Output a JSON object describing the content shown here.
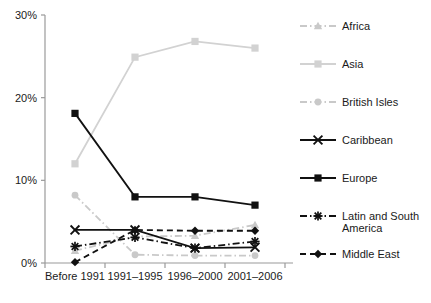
{
  "chart_data": {
    "type": "line",
    "title": "",
    "subtitle": "",
    "xlabel": "",
    "ylabel": "",
    "categories": [
      "Before 1991",
      "1991–1995",
      "1996–2000",
      "2001–2006"
    ],
    "ylim": [
      0,
      30
    ],
    "yticks": [
      0,
      10,
      20,
      30
    ],
    "ytick_labels": [
      "0%",
      "10%",
      "20%",
      "30%"
    ],
    "grid": false,
    "legend_position": "right",
    "value_unit": "percent",
    "series": [
      {
        "name": "Africa",
        "values": [
          1.5,
          3.2,
          3.3,
          4.6
        ],
        "color": "#c9c9c9",
        "marker": "triangle",
        "line_style": "dash-dot"
      },
      {
        "name": "Asia",
        "values": [
          12.0,
          24.9,
          26.8,
          26.0
        ],
        "color": "#d2d2d2",
        "marker": "square",
        "line_style": "solid"
      },
      {
        "name": "British Isles",
        "values": [
          8.2,
          1.0,
          0.9,
          0.9
        ],
        "color": "#c9c9c9",
        "marker": "circle",
        "line_style": "dash-dot"
      },
      {
        "name": "Caribbean",
        "values": [
          4.0,
          4.0,
          1.8,
          1.9
        ],
        "color": "#111111",
        "marker": "x",
        "line_style": "solid"
      },
      {
        "name": "Europe",
        "values": [
          18.1,
          8.0,
          8.0,
          7.0
        ],
        "color": "#111111",
        "marker": "square",
        "line_style": "solid"
      },
      {
        "name": "Latin and South America",
        "values": [
          2.0,
          3.1,
          1.8,
          2.6
        ],
        "color": "#111111",
        "marker": "asterisk",
        "line_style": "dash-dot"
      },
      {
        "name": "Middle East",
        "values": [
          0.1,
          4.0,
          3.9,
          3.9
        ],
        "color": "#111111",
        "marker": "diamond",
        "line_style": "dashed"
      }
    ]
  },
  "legend": {
    "entries": [
      {
        "label": "Africa"
      },
      {
        "label": "Asia"
      },
      {
        "label": "British Isles"
      },
      {
        "label": "Caribbean"
      },
      {
        "label": "Europe"
      },
      {
        "label": "Latin and South",
        "label2": "America"
      },
      {
        "label": "Middle East"
      }
    ]
  }
}
